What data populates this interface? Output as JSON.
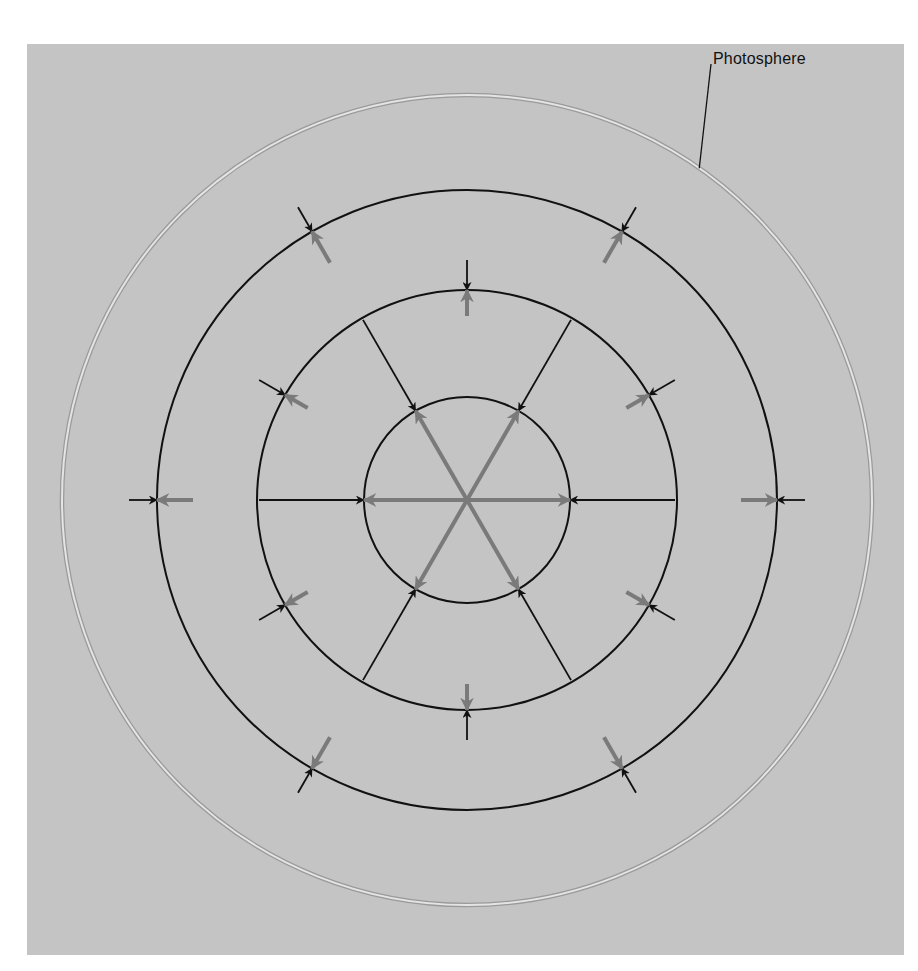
{
  "diagram": {
    "title": "",
    "colors": {
      "background": "#ffffff",
      "panel": "#c4c4c4",
      "ring": "#111111",
      "photosphere": "#e4e4e4",
      "photosphere_edge": "#9a9a9a",
      "inward_arrow": "#111111",
      "outward_arrow": "#7a7a7a"
    },
    "center": [
      467,
      500
    ],
    "photosphere": {
      "label": "Photosphere",
      "radius": 405
    },
    "rings": [
      {
        "name": "inner-ring",
        "radius": 103
      },
      {
        "name": "middle-ring",
        "radius": 210
      },
      {
        "name": "outer-ring",
        "radius": 310
      }
    ],
    "arrow_sets": [
      {
        "ring": "inner-ring",
        "angles_deg": [
          0,
          60,
          120,
          180,
          240,
          300
        ],
        "inward_len": 105,
        "outward_len": 103
      },
      {
        "ring": "middle-ring",
        "angles_deg": [
          30,
          90,
          150,
          210,
          270,
          330
        ],
        "inward_len": 30,
        "outward_len": 26
      },
      {
        "ring": "outer-ring",
        "angles_deg": [
          0,
          60,
          120,
          180,
          240,
          300
        ],
        "inward_len": 28,
        "outward_len": 36
      }
    ],
    "legend_note": "Black arrows point inward (gravity); grey arrows point outward (pressure)."
  }
}
